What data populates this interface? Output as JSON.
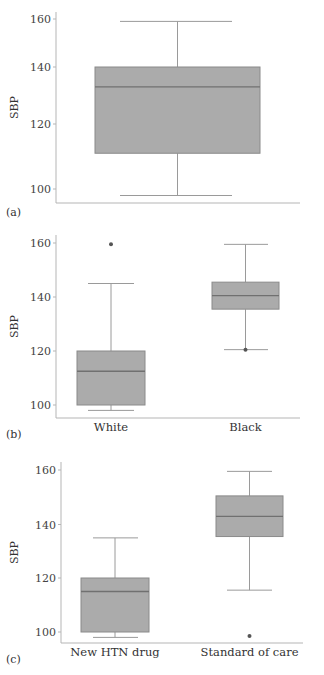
{
  "chart_data": [
    {
      "panel": "(a)",
      "type": "box",
      "title": "",
      "xlabel": "",
      "ylabel": "SBP",
      "yticks": [
        100,
        120,
        140,
        160
      ],
      "ylim": [
        96,
        162
      ],
      "grid": false,
      "categories": [
        ""
      ],
      "boxes": [
        {
          "category": "",
          "min": 98,
          "q1": 111,
          "median": 133,
          "q3": 140,
          "max": 159,
          "outliers": []
        }
      ],
      "layout": {
        "top": 12,
        "plot_left": 56,
        "plot_right": 300,
        "axis_y": 203,
        "tick_px": {
          "100": 189,
          "120": 124,
          "140": 67,
          "160": 19
        },
        "box_x": [
          [
            95,
            260
          ]
        ],
        "cap_x": [
          [
            120,
            232
          ]
        ],
        "label_y": 216
      }
    },
    {
      "panel": "(b)",
      "type": "box",
      "title": "",
      "xlabel": "",
      "ylabel": "SBP",
      "yticks": [
        100,
        120,
        140,
        160
      ],
      "ylim": [
        96,
        162
      ],
      "grid": false,
      "categories": [
        "White",
        "Black"
      ],
      "boxes": [
        {
          "category": "White",
          "min": 98,
          "q1": 100,
          "median": 112.5,
          "q3": 120,
          "max": 145,
          "outliers": [
            159.5
          ]
        },
        {
          "category": "Black",
          "min": 120.5,
          "q1": 135.5,
          "median": 140.5,
          "q3": 145.5,
          "max": 159.5,
          "outliers": [
            120.5
          ]
        }
      ],
      "layout": {
        "top": 235,
        "plot_left": 56,
        "plot_right": 300,
        "axis_y": 418,
        "tick_px": {
          "100": 405,
          "120": 351,
          "140": 297,
          "160": 243
        },
        "box_x": [
          [
            77,
            145
          ],
          [
            212,
            279
          ]
        ],
        "cap_x": [
          [
            88,
            134
          ],
          [
            224,
            268
          ]
        ],
        "label_y": 438,
        "cat_label_y": 431
      }
    },
    {
      "panel": "(c)",
      "type": "box",
      "title": "",
      "xlabel": "",
      "ylabel": "SBP",
      "yticks": [
        100,
        120,
        140,
        160
      ],
      "ylim": [
        96,
        162
      ],
      "grid": false,
      "categories": [
        "New HTN drug",
        "Standard of care"
      ],
      "boxes": [
        {
          "category": "New HTN drug",
          "min": 98,
          "q1": 100,
          "median": 115,
          "q3": 120,
          "max": 135,
          "outliers": []
        },
        {
          "category": "Standard of care",
          "min": 115.5,
          "q1": 135.5,
          "median": 143,
          "q3": 150.5,
          "max": 159.5,
          "outliers": [
            98.5
          ]
        }
      ],
      "layout": {
        "top": 462,
        "plot_left": 61,
        "plot_right": 303,
        "axis_y": 643,
        "tick_px": {
          "100": 632,
          "120": 578,
          "140": 524.5,
          "160": 470
        },
        "box_x": [
          [
            81,
            149
          ],
          [
            216,
            283
          ]
        ],
        "cap_x": [
          [
            93,
            138
          ],
          [
            227,
            272
          ]
        ],
        "label_y": 663,
        "cat_label_y": 656
      }
    }
  ],
  "style": {
    "box_fill": "#ababab",
    "box_stroke": "#8a8a8a",
    "median_stroke": "#707070",
    "whisker_stroke": "#9a9a9a",
    "axis_stroke": "#b5b5b5",
    "outlier_fill": "#555555"
  }
}
